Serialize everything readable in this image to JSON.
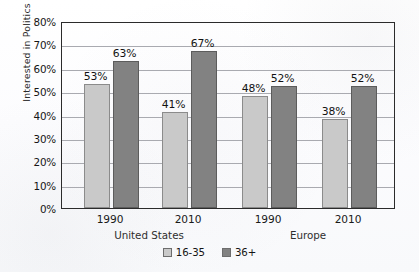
{
  "chart_data": {
    "type": "bar",
    "title": "",
    "xlabel": "",
    "ylabel": "Interested in Politics",
    "ylim": [
      0,
      80
    ],
    "ytick_labels": [
      "0%",
      "10%",
      "20%",
      "30%",
      "40%",
      "50%",
      "60%",
      "70%",
      "80%"
    ],
    "ytick_values": [
      0,
      10,
      20,
      30,
      40,
      50,
      60,
      70,
      80
    ],
    "grid": true,
    "legend_position": "bottom-center",
    "categories": [
      "1990",
      "2010",
      "1990",
      "2010"
    ],
    "group_labels": [
      "United States",
      "Europe"
    ],
    "groups": [
      {
        "region": "United States",
        "year": "1990",
        "values": {
          "16-35": 53,
          "36+": 63
        }
      },
      {
        "region": "United States",
        "year": "2010",
        "values": {
          "16-35": 41,
          "36+": 67
        }
      },
      {
        "region": "Europe",
        "year": "1990",
        "values": {
          "16-35": 48,
          "36+": 52
        }
      },
      {
        "region": "Europe",
        "year": "2010",
        "values": {
          "16-35": 38,
          "36+": 52
        }
      }
    ],
    "series": [
      {
        "name": "16-35",
        "color": "#c9c9c9",
        "values": [
          53,
          41,
          48,
          38
        ],
        "labels": [
          "53%",
          "41%",
          "48%",
          "38%"
        ]
      },
      {
        "name": "36+",
        "color": "#828282",
        "values": [
          63,
          67,
          52,
          52
        ],
        "labels": [
          "63%",
          "67%",
          "52%",
          "52%"
        ]
      }
    ],
    "legend": [
      {
        "label": "16-35",
        "color": "#c9c9c9"
      },
      {
        "label": "36+",
        "color": "#828282"
      }
    ],
    "colors": {
      "series_light": "#c9c9c9",
      "series_dark": "#828282",
      "axis": "#2b2b2b",
      "gridline": "#a9aab0",
      "background": "#fdfdfe",
      "text": "#141414"
    }
  }
}
